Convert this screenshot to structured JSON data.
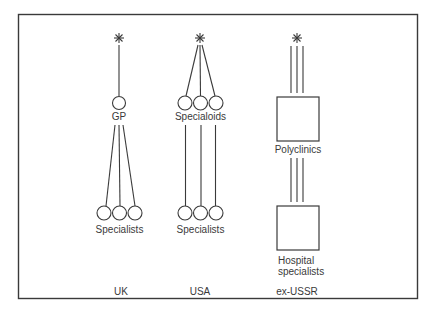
{
  "diagram": {
    "frame": {
      "x": 18,
      "y": 14,
      "w": 399,
      "h": 284,
      "color": "#3a3a3a"
    },
    "columns": [
      {
        "id": "uk",
        "country": "UK",
        "entry": "asterisk",
        "primary_label": "GP",
        "primary_shape": "circle",
        "primary_count": 1,
        "secondary_label": "Specialists",
        "secondary_shape": "circle",
        "secondary_count": 3,
        "entry_links": 1,
        "primary_to_secondary": "fan-out"
      },
      {
        "id": "usa",
        "country": "USA",
        "entry": "asterisk",
        "primary_label": "Specialoids",
        "primary_shape": "circle",
        "primary_count": 3,
        "secondary_label": "Specialists",
        "secondary_shape": "circle",
        "secondary_count": 3,
        "entry_links": 3,
        "primary_to_secondary": "parallel"
      },
      {
        "id": "ex-ussr",
        "country": "ex-USSR",
        "entry": "asterisk",
        "primary_label": "Polyclinics",
        "primary_shape": "square",
        "primary_count": 1,
        "secondary_label_line1": "Hospital",
        "secondary_label_line2": "specialists",
        "secondary_shape": "square",
        "secondary_count": 1,
        "entry_links": 3,
        "primary_to_secondary": "parallel"
      }
    ],
    "asterisk_glyph": "✳"
  }
}
